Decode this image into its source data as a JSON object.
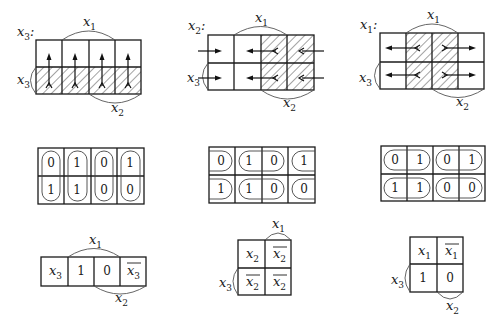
{
  "figure": {
    "top_row": [
      {
        "title_var": "x",
        "title_sub": "3",
        "title_suffix": ":",
        "arc_top": {
          "var": "x",
          "sub": "1"
        },
        "arc_left": {
          "var": "x",
          "sub": "3"
        },
        "arc_bottom": {
          "var": "x",
          "sub": "2"
        },
        "hatched_cells": "bottom row",
        "arrow_direction": "up"
      },
      {
        "title_var": "x",
        "title_sub": "2",
        "title_suffix": ":",
        "arc_top": {
          "var": "x",
          "sub": "1"
        },
        "arc_left": {
          "var": "x",
          "sub": "3"
        },
        "arc_bottom": {
          "var": "x",
          "sub": "2"
        },
        "hatched_cells": "columns 3-4",
        "arrow_direction": "horizontal inward"
      },
      {
        "title_var": "x",
        "title_sub": "1",
        "title_suffix": ":",
        "arc_top": {
          "var": "x",
          "sub": "1"
        },
        "arc_left": {
          "var": "x",
          "sub": "3"
        },
        "arc_bottom": {
          "var": "x",
          "sub": "2"
        },
        "hatched_cells": "columns 2-3",
        "arrow_direction": "horizontal outward"
      }
    ],
    "middle_row": [
      {
        "cells": [
          [
            "0",
            "1",
            "0",
            "1"
          ],
          [
            "1",
            "1",
            "0",
            "0"
          ]
        ],
        "grouping": "vertical pairs"
      },
      {
        "cells": [
          [
            "0",
            "1",
            "0",
            "1"
          ],
          [
            "1",
            "1",
            "0",
            "0"
          ]
        ],
        "grouping": "horizontal pairs (wrap)"
      },
      {
        "cells": [
          [
            "0",
            "1",
            "0",
            "1"
          ],
          [
            "1",
            "1",
            "0",
            "0"
          ]
        ],
        "grouping": "horizontal pairs"
      }
    ],
    "bottom_row": [
      {
        "cells": [
          [
            "x3",
            "1",
            "0",
            "x̄3"
          ]
        ],
        "cell_display": [
          [
            {
              "v": "x",
              "s": "3",
              "bar": false
            },
            {
              "v": "1",
              "s": "",
              "bar": false
            },
            {
              "v": "0",
              "s": "",
              "bar": false
            },
            {
              "v": "x",
              "s": "3",
              "bar": true
            }
          ]
        ],
        "arc_top": {
          "var": "x",
          "sub": "1"
        },
        "arc_bottom": {
          "var": "x",
          "sub": "2"
        }
      },
      {
        "cells": [
          [
            "x2",
            "x̄2"
          ],
          [
            "x̄2",
            "x̄2"
          ]
        ],
        "cell_display": [
          [
            {
              "v": "x",
              "s": "2",
              "bar": false
            },
            {
              "v": "x",
              "s": "2",
              "bar": true
            }
          ],
          [
            {
              "v": "x",
              "s": "2",
              "bar": true
            },
            {
              "v": "x",
              "s": "2",
              "bar": true
            }
          ]
        ],
        "arc_top": {
          "var": "x",
          "sub": "1"
        },
        "arc_left": {
          "var": "x",
          "sub": "3"
        }
      },
      {
        "cells": [
          [
            "x1",
            "x̄1"
          ],
          [
            "1",
            "0"
          ]
        ],
        "cell_display": [
          [
            {
              "v": "x",
              "s": "1",
              "bar": false
            },
            {
              "v": "x",
              "s": "1",
              "bar": true
            }
          ],
          [
            {
              "v": "1",
              "s": "",
              "bar": false
            },
            {
              "v": "0",
              "s": "",
              "bar": false
            }
          ]
        ],
        "arc_left": {
          "var": "x",
          "sub": "3"
        },
        "arc_bottom": {
          "var": "x",
          "sub": "2"
        }
      }
    ]
  }
}
